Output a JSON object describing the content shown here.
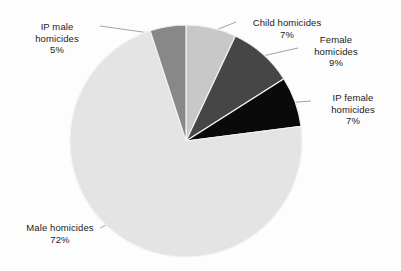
{
  "chart_data": {
    "type": "pie",
    "title": "",
    "subtitle": "",
    "xlabel": "",
    "ylabel": "",
    "legend_position": "none",
    "grid": false,
    "labels_outside": true,
    "start_angle_deg": 0,
    "direction": "clockwise",
    "categories": [
      "Child homicides",
      "Female homicides",
      "IP female homicides",
      "Male homicides",
      "IP male homicides"
    ],
    "values": [
      7,
      9,
      7,
      72,
      5
    ],
    "value_unit": "%",
    "colors": [
      "#c8c8c8",
      "#464646",
      "#0a0a0a",
      "#e4e4e4",
      "#888888"
    ],
    "slices": [
      {
        "name": "Child homicides",
        "value": 7,
        "value_label": "7%",
        "color": "#c8c8c8"
      },
      {
        "name": "Female homicides",
        "value": 9,
        "value_label": "9%",
        "color": "#464646"
      },
      {
        "name": "IP female homicides",
        "value": 7,
        "value_label": "7%",
        "color": "#0a0a0a"
      },
      {
        "name": "Male homicides",
        "value": 72,
        "value_label": "72%",
        "color": "#e4e4e4"
      },
      {
        "name": "IP male homicides",
        "value": 5,
        "value_label": "5%",
        "color": "#888888"
      }
    ]
  },
  "labels": {
    "ip_male": {
      "line1": "IP male",
      "line2": "homicides",
      "pct": "5%"
    },
    "child": {
      "line1": "Child homicides",
      "line2": "",
      "pct": "7%"
    },
    "female": {
      "line1": "Female",
      "line2": "homicides",
      "pct": "9%"
    },
    "ip_female": {
      "line1": "IP female",
      "line2": "homicides",
      "pct": "7%"
    },
    "male": {
      "line1": "Male homicides",
      "line2": "",
      "pct": "72%"
    }
  },
  "style": {
    "background": "#fdfdfd",
    "text_color": "#1b1b1b",
    "leader_line_color": "#9a9a9a",
    "slice_separator_color": "#f2f2f2"
  }
}
